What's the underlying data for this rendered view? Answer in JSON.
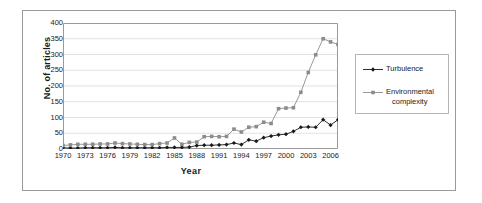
{
  "chart_data": {
    "type": "line",
    "title": "",
    "xlabel": "Year",
    "ylabel": "No. of articles",
    "ylim": [
      0,
      400
    ],
    "ytick_step": 50,
    "yticks": [
      400,
      350,
      300,
      250,
      200,
      150,
      100,
      50,
      0
    ],
    "xlim": [
      1970,
      2007
    ],
    "xticks": [
      1970,
      1973,
      1976,
      1979,
      1982,
      1985,
      1988,
      1991,
      1994,
      1997,
      2000,
      2003,
      2006
    ],
    "grid": "horizontal",
    "legend_position": "right",
    "x": [
      1970,
      1971,
      1972,
      1973,
      1974,
      1975,
      1976,
      1977,
      1978,
      1979,
      1980,
      1981,
      1982,
      1983,
      1984,
      1985,
      1986,
      1987,
      1988,
      1989,
      1990,
      1991,
      1992,
      1993,
      1994,
      1995,
      1996,
      1997,
      1998,
      1999,
      2000,
      2001,
      2002,
      2003,
      2004,
      2005,
      2006,
      2007
    ],
    "series": [
      {
        "name": "Turbulence",
        "color": "#1a1a1a",
        "marker": "diamond",
        "values": [
          4,
          3,
          3,
          4,
          4,
          4,
          4,
          5,
          4,
          4,
          4,
          4,
          4,
          4,
          5,
          5,
          5,
          6,
          11,
          12,
          12,
          13,
          14,
          19,
          14,
          29,
          25,
          36,
          41,
          45,
          47,
          56,
          69,
          70,
          69,
          93,
          76,
          93
        ]
      },
      {
        "name": "Environmental complexity",
        "color": "#8c8c8c",
        "marker": "square",
        "values": [
          11,
          13,
          15,
          15,
          15,
          16,
          16,
          19,
          17,
          16,
          15,
          14,
          14,
          17,
          19,
          35,
          15,
          21,
          22,
          39,
          40,
          39,
          40,
          63,
          54,
          69,
          71,
          85,
          81,
          128,
          130,
          131,
          180,
          243,
          299,
          350,
          340,
          332
        ]
      }
    ]
  },
  "axes": {
    "ylabel": "No. of articles",
    "xlabel": "Year"
  },
  "legend": {
    "items": [
      {
        "label": "Turbulence",
        "label_line2": "",
        "color": "#1a1a1a",
        "marker": "diamond"
      },
      {
        "label": "Environmental",
        "label_line2": "complexity",
        "color": "#8c8c8c",
        "marker": "square"
      }
    ]
  }
}
